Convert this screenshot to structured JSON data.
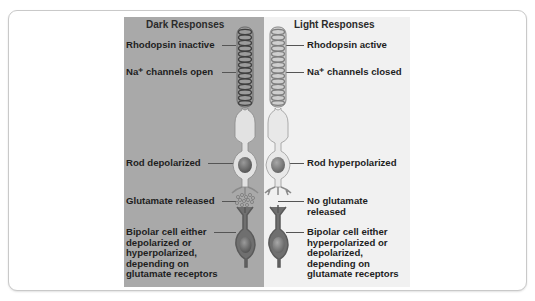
{
  "figure": {
    "dark": {
      "heading": "Dark Responses",
      "labels": {
        "rhodopsin": "Rhodopsin inactive",
        "channels": "Na⁺ channels open",
        "rod": "Rod depolarized",
        "glutamate": "Glutamate released",
        "bipolar_1": "Bipolar cell either",
        "bipolar_2": "depolarized or",
        "bipolar_3": "hyperpolarized,",
        "bipolar_4": "depending on",
        "bipolar_5": "glutamate receptors"
      },
      "background": "#a9a9a9"
    },
    "light": {
      "heading": "Light Responses",
      "labels": {
        "rhodopsin": "Rhodopsin active",
        "channels": "Na⁺ channels closed",
        "rod": "Rod hyperpolarized",
        "glutamate_1": "No glutamate",
        "glutamate_2": "released",
        "bipolar_1": "Bipolar cell either",
        "bipolar_2": "hyperpolarized or",
        "bipolar_3": "depolarized,",
        "bipolar_4": "depending on",
        "bipolar_5": "glutamate receptors"
      },
      "background": "#f1f1f1"
    }
  }
}
